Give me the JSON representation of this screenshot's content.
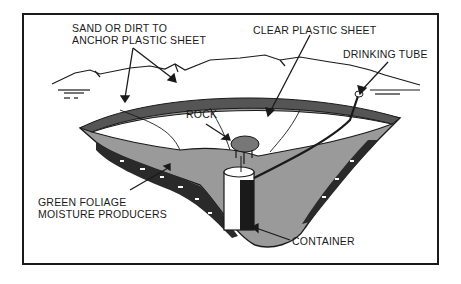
{
  "diagram": {
    "labels": {
      "sand_line1": "SAND OR DIRT TO",
      "sand_line2": "ANCHOR PLASTIC SHEET",
      "clear_plastic": "CLEAR PLASTIC SHEET",
      "drinking_tube": "DRINKING TUBE",
      "rock": "ROCK",
      "foliage_line1": "GREEN FOLIAGE",
      "foliage_line2": "MOISTURE PRODUCERS",
      "container": "CONTAINER"
    },
    "colors": {
      "ink": "#1a1a1a",
      "soil": "#9a9a9a",
      "dark_soil": "#3a3a3a",
      "background": "#ffffff"
    }
  }
}
